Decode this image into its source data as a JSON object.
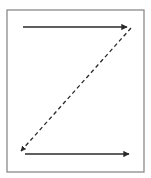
{
  "diagram": {
    "type": "z-pattern-reading-flow",
    "frame": {
      "x": 7,
      "y": 10,
      "width": 137,
      "height": 162,
      "stroke": "#8a8a8a"
    },
    "arrows": [
      {
        "name": "top-arrow",
        "style": "solid",
        "from": [
          23,
          27
        ],
        "to": [
          127,
          27
        ],
        "color": "#2a2a2a"
      },
      {
        "name": "diagonal-arrow",
        "style": "dashed",
        "from": [
          131,
          28
        ],
        "to": [
          21,
          151
        ],
        "color": "#2a2a2a"
      },
      {
        "name": "bottom-arrow",
        "style": "solid",
        "from": [
          25,
          154
        ],
        "to": [
          129,
          154
        ],
        "color": "#2a2a2a"
      }
    ]
  }
}
